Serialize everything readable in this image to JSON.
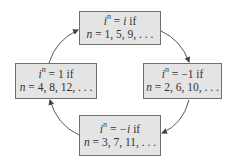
{
  "diagram": {
    "type": "cycle",
    "colors": {
      "box_fill": "#e4e4e4",
      "box_border": "#707070",
      "arrow": "#444444",
      "text": "#333333"
    },
    "nodes": [
      {
        "id": "top",
        "base": "i",
        "exponent": "n",
        "equals": "=",
        "value": "i",
        "condition": "if",
        "n_label": "n",
        "n_values": "= 1, 5, 9, . . ."
      },
      {
        "id": "right",
        "base": "i",
        "exponent": "n",
        "equals": "=",
        "value": "−1",
        "condition": "if",
        "n_label": "n",
        "n_values": "= 2, 6, 10, . . ."
      },
      {
        "id": "bottom",
        "base": "i",
        "exponent": "n",
        "equals": "=",
        "value": "−i",
        "condition": "if",
        "n_label": "n",
        "n_values": "= 3, 7, 11, . . ."
      },
      {
        "id": "left",
        "base": "i",
        "exponent": "n",
        "equals": "=",
        "value": "1",
        "condition": "if",
        "n_label": "n",
        "n_values": "= 4, 8, 12, . . ."
      }
    ],
    "edges": [
      {
        "from": "top",
        "to": "right",
        "direction": "clockwise"
      },
      {
        "from": "right",
        "to": "bottom",
        "direction": "clockwise"
      },
      {
        "from": "bottom",
        "to": "left",
        "direction": "clockwise"
      },
      {
        "from": "left",
        "to": "top",
        "direction": "clockwise"
      }
    ]
  }
}
